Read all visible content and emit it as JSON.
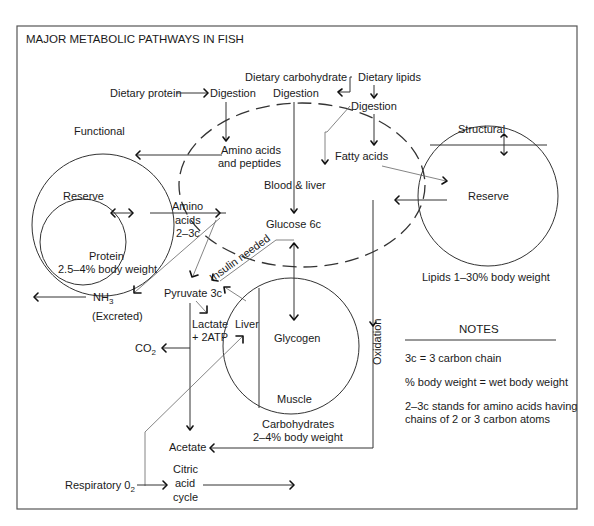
{
  "title": "MAJOR METABOLIC PATHWAYS IN FISH",
  "inputs": {
    "dietary_protein": "Dietary protein",
    "dietary_carbohydrate": "Dietary carbohydrate",
    "dietary_lipids": "Dietary lipids",
    "digestion_protein": "Digestion",
    "digestion_carb": "Digestion",
    "digestion_lipids": "Digestion"
  },
  "blood_liver": {
    "label": "Blood & liver",
    "amino_acids_line1": "Amino acids",
    "amino_acids_line2": "and peptides",
    "fatty_acids": "Fatty acids",
    "glucose": "Glucose 6c"
  },
  "protein_pool": {
    "functional": "Functional",
    "reserve": "Reserve",
    "caption_line1": "Protein",
    "caption_line2": "2.5–4% body weight",
    "amino_line1": "Amino",
    "amino_line2": "acids",
    "amino_line3": "2–3c"
  },
  "lipid_pool": {
    "structural": "Structural",
    "reserve": "Reserve",
    "caption": "Lipids 1–30% body weight"
  },
  "carb_pool": {
    "glycogen": "Glycogen",
    "liver": "Liver",
    "muscle": "Muscle",
    "caption_line1": "Carbohydrates",
    "caption_line2": "2–4% body weight"
  },
  "metabolites": {
    "insulin": "Insulin needed",
    "pyruvate": "Pyruvate 3c",
    "nh3": "NH",
    "nh3_sub": "3",
    "excreted": "(Excreted)",
    "lactate_line1": "Lactate",
    "lactate_line2": "+ 2ATP",
    "co2": "CO",
    "co2_sub": "2",
    "oxidation": "Oxidation",
    "acetate": "Acetate",
    "respiratory": "Respiratory 0",
    "respiratory_sub": "2",
    "citric_line1": "Citric",
    "citric_line2": "acid",
    "citric_line3": "cycle"
  },
  "notes": {
    "heading": "NOTES",
    "items": [
      "3c = 3 carbon chain",
      "% body weight = wet body weight",
      "2–3c stands for amino acids having",
      "chains of 2 or 3 carbon atoms"
    ]
  }
}
